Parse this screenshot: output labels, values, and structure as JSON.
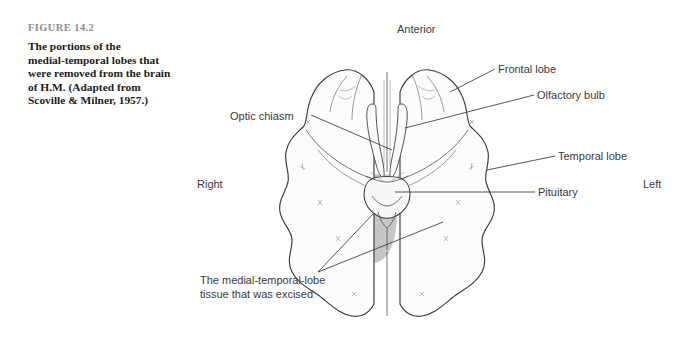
{
  "figure": {
    "number": "FIGURE 14.2",
    "caption": "The portions of the\nmedial-temporal lobes that\nwere removed from the brain\nof H.M. (Adapted from\nScoville & Milner, 1957.)"
  },
  "orientation": {
    "anterior": "Anterior",
    "right": "Right",
    "left": "Left"
  },
  "labels": {
    "optic_chiasm": "Optic chiasm",
    "frontal_lobe": "Frontal lobe",
    "olfactory_bulb": "Olfactory bulb",
    "temporal_lobe": "Temporal lobe",
    "pituitary": "Pituitary",
    "excised_tissue": "The medial-temporal-lobe\ntissue that was excised"
  },
  "colors": {
    "page_background": "#ffffff",
    "figure_number_text": "#8d8d8d",
    "caption_text": "#1b1b1b",
    "label_text": "#3a3a3a",
    "excised_shading": "#c6c6c6",
    "brain_outline": "#3a3a3a",
    "leader_line": "#2b2b2b"
  },
  "diagram": {
    "name": "ventral-view-of-human-brain",
    "view": "inferior (ventral) surface",
    "shaded_region_meaning": "medial-temporal-lobe tissue that was excised"
  }
}
